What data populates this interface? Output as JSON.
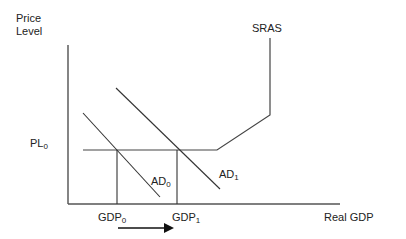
{
  "diagram": {
    "type": "AD-AS model",
    "y_axis_label_line1": "Price",
    "y_axis_label_line2": "Level",
    "x_axis_label": "Real GDP",
    "curves": {
      "sras": "SRAS",
      "ad0_main": "AD",
      "ad0_sub": "0",
      "ad1_main": "AD",
      "ad1_sub": "1"
    },
    "price_level": {
      "main": "PL",
      "sub": "0"
    },
    "gdp0": {
      "main": "GDP",
      "sub": "0"
    },
    "gdp1": {
      "main": "GDP",
      "sub": "1"
    },
    "shift_arrow": "GDP0 to GDP1",
    "colors": {
      "line": "#333333",
      "background": "#ffffff"
    }
  }
}
